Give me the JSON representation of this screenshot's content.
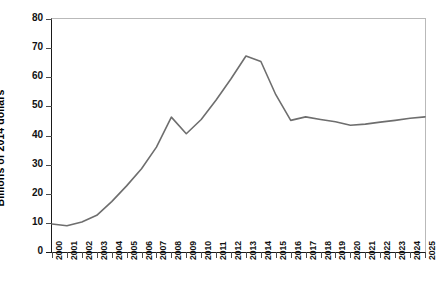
{
  "chart_data": {
    "type": "line",
    "title": "",
    "xlabel": "",
    "ylabel": "Billions of 2014 dollars",
    "xlim": [
      2000,
      2025
    ],
    "ylim": [
      0,
      80
    ],
    "ytick_labels": [
      "0",
      "10",
      "20",
      "30",
      "40",
      "50",
      "60",
      "70",
      "80"
    ],
    "ytick_values": [
      0,
      10,
      20,
      30,
      40,
      50,
      60,
      70,
      80
    ],
    "grid": false,
    "legend": "none",
    "line_color": "#6e6e6e",
    "axis_color": "#1a1a1a",
    "frame_color": "#b9b9b9",
    "categories": [
      "2000",
      "2001",
      "2002",
      "2003",
      "2004",
      "2005",
      "2006",
      "2007",
      "2008",
      "2009",
      "2010",
      "2011",
      "2012",
      "2013",
      "2014",
      "2015",
      "2016",
      "2017",
      "2018",
      "2019",
      "2020",
      "2021",
      "2022",
      "2023",
      "2024",
      "2025"
    ],
    "x": [
      2000,
      2001,
      2002,
      2003,
      2004,
      2005,
      2006,
      2007,
      2008,
      2009,
      2010,
      2011,
      2012,
      2013,
      2014,
      2015,
      2016,
      2017,
      2018,
      2019,
      2020,
      2021,
      2022,
      2023,
      2024,
      2025
    ],
    "values": [
      9.6,
      9.0,
      10.3,
      12.6,
      17.3,
      22.7,
      28.6,
      36.0,
      46.3,
      40.6,
      45.5,
      52.2,
      59.5,
      67.3,
      65.4,
      54.0,
      45.2,
      46.4,
      45.5,
      44.7,
      43.5,
      43.9,
      44.6,
      45.2,
      45.9,
      46.4
    ]
  }
}
